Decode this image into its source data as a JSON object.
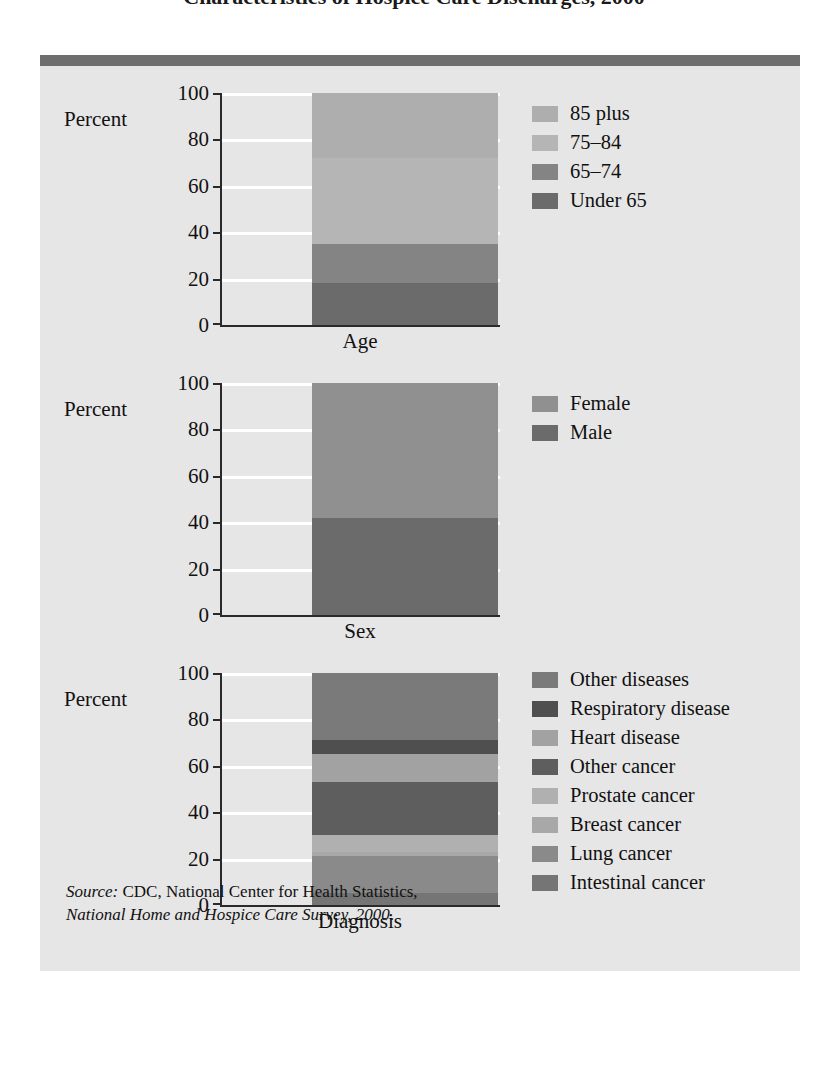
{
  "title_clipped": "Characteristics of Hospice Care Discharges, 2000",
  "panel": {
    "percent_label": "Percent",
    "source_prefix": "Source:",
    "source_line1": " CDC, National Center for Health Statistics,",
    "source_line2_italic": "National Home and Hospice Care Survey, 2000",
    "source_line2_tail": "."
  },
  "axis": {
    "ticks": [
      "100",
      "80",
      "60",
      "40",
      "20",
      "0"
    ],
    "tick_values": [
      100,
      80,
      60,
      40,
      20,
      0
    ]
  },
  "colors": {
    "panel_bg": "#e6e6e6",
    "rule": "#6e6e6e",
    "axis": "#2a2a2a",
    "grid": "#ffffff",
    "age_under65": "#6b6b6b",
    "age_65_74": "#848484",
    "age_75_84": "#b5b5b5",
    "age_85plus": "#aeaeae",
    "sex_male": "#6b6b6b",
    "sex_female": "#909090",
    "dx_intestinal": "#757575",
    "dx_lung": "#8a8a8a",
    "dx_breast": "#a8a8a8",
    "dx_prostate": "#b0b0b0",
    "dx_other_cancer": "#5e5e5e",
    "dx_heart": "#a2a2a2",
    "dx_respiratory": "#4f4f4f",
    "dx_other_disease": "#7a7a7a"
  },
  "chart_data": [
    {
      "type": "bar",
      "stacked": true,
      "title": "",
      "xlabel": "Age",
      "ylabel": "Percent",
      "ylim": [
        0,
        100
      ],
      "yticks": [
        0,
        20,
        40,
        60,
        80,
        100
      ],
      "grid": true,
      "legend_position": "right",
      "categories": [
        "Age"
      ],
      "series": [
        {
          "name": "85 plus",
          "values": [
            28
          ],
          "start": 72,
          "end": 100,
          "color": "#aeaeae"
        },
        {
          "name": "75–84",
          "values": [
            37
          ],
          "start": 35,
          "end": 72,
          "color": "#b5b5b5"
        },
        {
          "name": "65–74",
          "values": [
            17
          ],
          "start": 18,
          "end": 35,
          "color": "#848484"
        },
        {
          "name": "Under 65",
          "values": [
            18
          ],
          "start": 0,
          "end": 18,
          "color": "#6b6b6b"
        }
      ],
      "legend_order": [
        "85 plus",
        "75–84",
        "65–74",
        "Under 65"
      ]
    },
    {
      "type": "bar",
      "stacked": true,
      "title": "",
      "xlabel": "Sex",
      "ylabel": "Percent",
      "ylim": [
        0,
        100
      ],
      "yticks": [
        0,
        20,
        40,
        60,
        80,
        100
      ],
      "grid": true,
      "legend_position": "right",
      "categories": [
        "Sex"
      ],
      "series": [
        {
          "name": "Female",
          "values": [
            58
          ],
          "start": 42,
          "end": 100,
          "color": "#909090"
        },
        {
          "name": "Male",
          "values": [
            42
          ],
          "start": 0,
          "end": 42,
          "color": "#6b6b6b"
        }
      ],
      "legend_order": [
        "Female",
        "Male"
      ]
    },
    {
      "type": "bar",
      "stacked": true,
      "title": "",
      "xlabel": "Diagnosis",
      "ylabel": "Percent",
      "ylim": [
        0,
        100
      ],
      "yticks": [
        0,
        20,
        40,
        60,
        80,
        100
      ],
      "grid": true,
      "legend_position": "right",
      "categories": [
        "Diagnosis"
      ],
      "series": [
        {
          "name": "Other diseases",
          "values": [
            29
          ],
          "start": 71,
          "end": 100,
          "color": "#7a7a7a"
        },
        {
          "name": "Respiratory disease",
          "values": [
            6
          ],
          "start": 65,
          "end": 71,
          "color": "#4f4f4f"
        },
        {
          "name": "Heart disease",
          "values": [
            12
          ],
          "start": 53,
          "end": 65,
          "color": "#a2a2a2"
        },
        {
          "name": "Other cancer",
          "values": [
            23
          ],
          "start": 30,
          "end": 53,
          "color": "#5e5e5e"
        },
        {
          "name": "Prostate cancer",
          "values": [
            7
          ],
          "start": 23,
          "end": 30,
          "color": "#b0b0b0"
        },
        {
          "name": "Breast cancer",
          "values": [
            2
          ],
          "start": 21,
          "end": 23,
          "color": "#a8a8a8"
        },
        {
          "name": "Lung cancer",
          "values": [
            16
          ],
          "start": 5,
          "end": 21,
          "color": "#8a8a8a"
        },
        {
          "name": "Intestinal cancer",
          "values": [
            5
          ],
          "start": 0,
          "end": 5,
          "color": "#757575"
        }
      ],
      "legend_order": [
        "Other diseases",
        "Respiratory disease",
        "Heart disease",
        "Other cancer",
        "Prostate cancer",
        "Breast cancer",
        "Lung cancer",
        "Intestinal cancer"
      ]
    }
  ]
}
